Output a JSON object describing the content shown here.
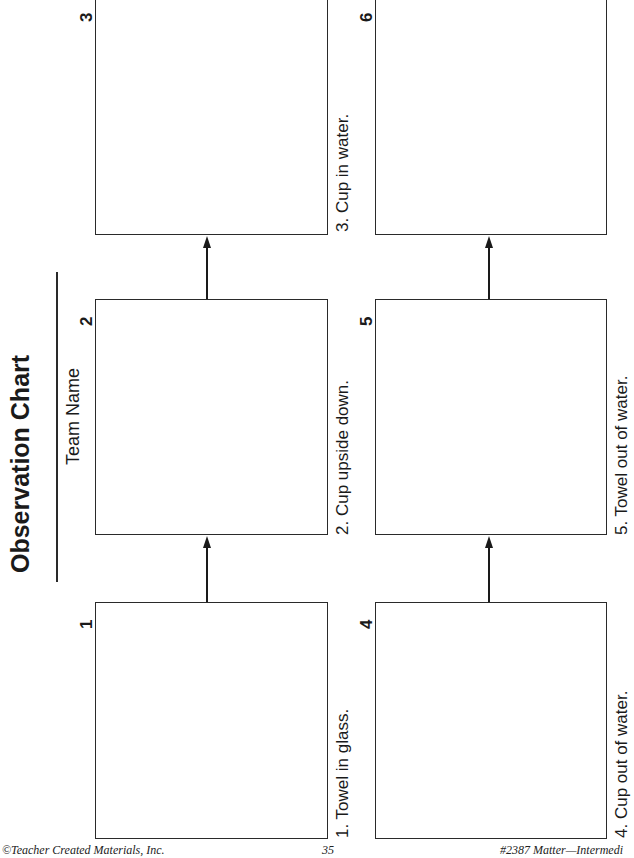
{
  "page": {
    "title": "Observation Chart",
    "team_name_label": "Team Name",
    "orientation": "rotated-90-ccw"
  },
  "panels": [
    {
      "number": "1",
      "caption": "1.  Towel in glass."
    },
    {
      "number": "2",
      "caption": "2.  Cup upside down."
    },
    {
      "number": "3",
      "caption": "3.  Cup in water."
    },
    {
      "number": "4",
      "caption": "4.  Cup out of water."
    },
    {
      "number": "5",
      "caption": "5.  Towel out of water."
    },
    {
      "number": "6",
      "caption": ""
    }
  ],
  "footer": {
    "copyright": "©Teacher Created Materials, Inc.",
    "page_number": "35",
    "product": "#2387 Matter—Intermedi"
  },
  "colors": {
    "ink": "#1a1a1a",
    "background": "#ffffff"
  }
}
